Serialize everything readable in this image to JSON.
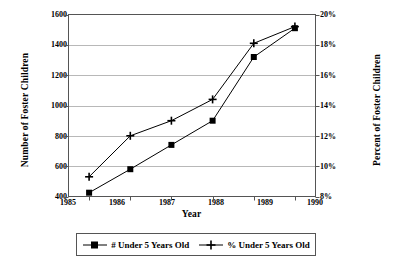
{
  "chart_data": {
    "type": "line",
    "title": "",
    "xlabel": "Year",
    "ylabel": "Number of Foster Children",
    "ylabel_right": "Percent of Foster Children",
    "categories": [
      "1985",
      "1986",
      "1987",
      "1988",
      "1989",
      "1990"
    ],
    "ylim": [
      400,
      1600
    ],
    "ytick_step": 200,
    "yticks": [
      "400",
      "600",
      "800",
      "1000",
      "1200",
      "1400",
      "1600"
    ],
    "ylim_right": [
      8,
      20
    ],
    "ytick_step_right": 2,
    "yticks_right": [
      "8%",
      "10%",
      "12%",
      "14%",
      "16%",
      "18%",
      "20%"
    ],
    "grid": true,
    "legend_position": "bottom",
    "series": [
      {
        "name": "# Under 5 Years Old",
        "axis": "left",
        "marker": "square",
        "values": [
          425,
          580,
          740,
          900,
          1320,
          1510
        ]
      },
      {
        "name": "% Under 5 Years Old",
        "axis": "right",
        "marker": "plus",
        "values": [
          9.3,
          12.0,
          13.0,
          14.4,
          18.1,
          19.2
        ]
      }
    ],
    "colors": {
      "line": "#000000",
      "marker": "#000000",
      "grid": "#b8b8b8",
      "frame": "#555555",
      "background": "#ffffff"
    }
  },
  "legend": {
    "entries": [
      {
        "label": "# Under 5 Years Old",
        "marker": "square-marker-icon"
      },
      {
        "label": "% Under 5 Years Old",
        "marker": "plus-marker-icon"
      }
    ]
  }
}
